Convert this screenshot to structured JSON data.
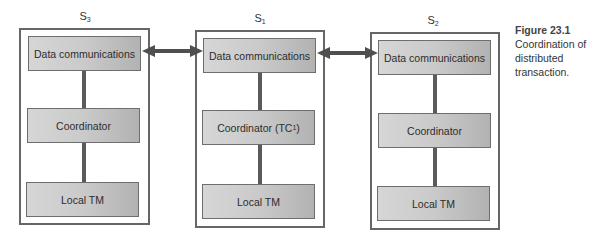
{
  "diagram": {
    "type": "distributed-transaction-coordination",
    "sites": [
      {
        "id": "S3",
        "label": "S",
        "subscript": "3",
        "components": {
          "data_comm": "Data communications",
          "coordinator": "Coordinator",
          "coordinator_sub": "",
          "coordinator_suffix": "",
          "local_tm": "Local TM"
        }
      },
      {
        "id": "S1",
        "label": "S",
        "subscript": "1",
        "components": {
          "data_comm": "Data communications",
          "coordinator": "Coordinator (TC",
          "coordinator_sub": "1",
          "coordinator_suffix": ")",
          "local_tm": "Local TM"
        }
      },
      {
        "id": "S2",
        "label": "S",
        "subscript": "2",
        "components": {
          "data_comm": "Data communications",
          "coordinator": "Coordinator",
          "coordinator_sub": "",
          "coordinator_suffix": "",
          "local_tm": "Local TM"
        }
      }
    ],
    "connections": [
      {
        "from": "S3.data_comm",
        "to": "S1.data_comm",
        "type": "bidirectional"
      },
      {
        "from": "S1.data_comm",
        "to": "S2.data_comm",
        "type": "bidirectional"
      }
    ],
    "colors": {
      "site_border": "#666666",
      "node_fill_light": "#d6d6d6",
      "node_fill_dark": "#b2b2b2",
      "connector": "#5a5a5a"
    }
  },
  "caption": {
    "figure": "Figure 23.1",
    "text": "Coordination of distributed transaction."
  }
}
